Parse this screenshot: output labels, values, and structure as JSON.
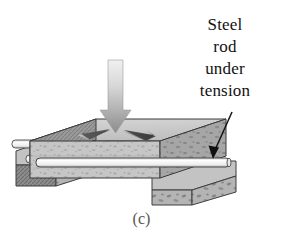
{
  "figure": {
    "caption": "(c)",
    "annotation": {
      "lines": [
        "Steel",
        "rod",
        "under",
        "tension"
      ],
      "full_text": "Steel rod under tension"
    },
    "parts": {
      "load_arrow": "downward-load-arrow",
      "slab": "prestressed-concrete-slab",
      "steel_rod": "steel-rod",
      "left_support": "left-support-block",
      "right_support": "right-support-block",
      "compression_arrows": "internal-compression-arrows",
      "pointer_line": "annotation-pointer-arrow"
    },
    "colors": {
      "background": "#ffffff",
      "concrete_top": "#c9c9c9",
      "concrete_front": "#c4c4c4",
      "concrete_side": "#9a9a9a",
      "support_top": "#bdbdbd",
      "support_front": "#9e9e9e",
      "support_side": "#8a8a8a",
      "rod_light": "#f2f2f2",
      "rod_shade": "#bdbdbd",
      "arrow_light": "#e2e2e2",
      "arrow_dark": "#8f8f8f",
      "outline": "#3a3a3a",
      "text": "#111111",
      "caption": "#555555"
    }
  }
}
